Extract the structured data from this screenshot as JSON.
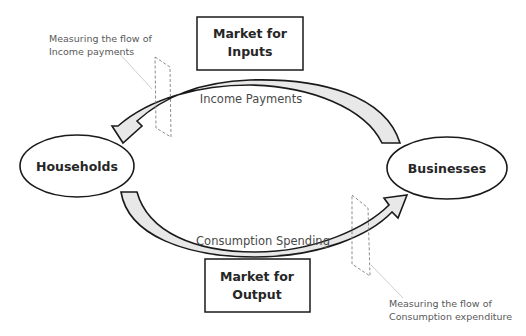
{
  "diagram": {
    "type": "circular-flow",
    "nodes": {
      "households": {
        "label": "Households"
      },
      "businesses": {
        "label": "Businesses"
      }
    },
    "markets": {
      "inputs": {
        "line1": "Market for",
        "line2": "Inputs"
      },
      "output": {
        "line1": "Market for",
        "line2": "Output"
      }
    },
    "flows": {
      "income": {
        "label": "Income Payments",
        "from": "Businesses",
        "to": "Households"
      },
      "consumption": {
        "label": "Consumption Spending",
        "from": "Households",
        "to": "Businesses"
      }
    },
    "annotations": {
      "income_measure": {
        "line1": "Measuring the flow of",
        "line2": "Income payments"
      },
      "consumption_measure": {
        "line1": "Measuring the flow of",
        "line2": "Consumption expenditure"
      }
    },
    "colors": {
      "stroke": "#1a1a1a",
      "arrow_fill": "#e6e6e6",
      "dashed": "#7f7f7f",
      "leader": "#c8c8c8",
      "background": "#ffffff"
    }
  }
}
